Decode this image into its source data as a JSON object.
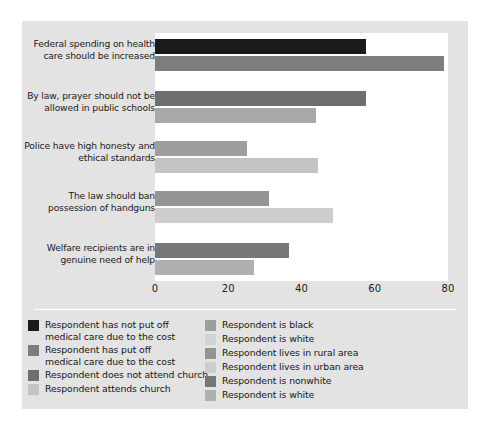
{
  "chart_data": {
    "type": "bar",
    "orientation": "horizontal",
    "title": "",
    "xlabel": "",
    "ylabel": "",
    "xlim": [
      0,
      80
    ],
    "xticks": [
      "0",
      "20",
      "40",
      "60",
      "80"
    ],
    "grid": false,
    "legend_position": "bottom",
    "categories": [
      "Federal spending on health\ncare should be increased",
      "By law, prayer should not be\nallowed in public schools",
      "Police have high honesty and\nethical standards",
      "The law should ban\npossession of handguns",
      "Welfare recipients are in\ngenuine need of help"
    ],
    "groups": [
      {
        "category": "Federal spending on health care should be increased",
        "bars": [
          {
            "label": "Respondent has not put off medical care due to the cost",
            "value": 57.5,
            "color": "#1a1a1a"
          },
          {
            "label": "Respondent has put off medical care due to the cost",
            "value": 79.0,
            "color": "#7d7d7d"
          }
        ]
      },
      {
        "category": "By law, prayer should not be allowed in public schools",
        "bars": [
          {
            "label": "Respondent does not attend church",
            "value": 57.5,
            "color": "#6e6e6e"
          },
          {
            "label": "Respondent attends church",
            "value": 44.0,
            "color": "#a8a8a8"
          }
        ]
      },
      {
        "category": "Police have high honesty and ethical standards",
        "bars": [
          {
            "label": "Respondent is black",
            "value": 25.0,
            "color": "#9e9e9e"
          },
          {
            "label": "Respondent is white",
            "value": 44.5,
            "color": "#c4c4c4"
          }
        ]
      },
      {
        "category": "The law should ban possession of handguns",
        "bars": [
          {
            "label": "Respondent lives in rural area",
            "value": 31.0,
            "color": "#949494"
          },
          {
            "label": "Respondent lives in urban area",
            "value": 48.5,
            "color": "#cdcdcd"
          }
        ]
      },
      {
        "category": "Welfare recipients are in genuine need of help",
        "bars": [
          {
            "label": "Respondent is nonwhite",
            "value": 36.5,
            "color": "#777777"
          },
          {
            "label": "Respondent is white",
            "value": 27.0,
            "color": "#b0b0b0"
          }
        ]
      }
    ],
    "legend": {
      "left_column": [
        {
          "label": "Respondent has not put off\nmedical care due to the cost",
          "color": "#1a1a1a"
        },
        {
          "label": "Respondent has put off\nmedical care due to the cost",
          "color": "#7d7d7d"
        },
        {
          "label": "Respondent does not attend church",
          "color": "#6e6e6e"
        },
        {
          "label": "Respondent attends church",
          "color": "#c4c4c4"
        }
      ],
      "right_column": [
        {
          "label": "Respondent is black",
          "color": "#9e9e9e"
        },
        {
          "label": "Respondent is white",
          "color": "#d3d3d3"
        },
        {
          "label": "Respondent lives in rural area",
          "color": "#949494"
        },
        {
          "label": "Respondent lives in urban area",
          "color": "#cdcdcd"
        },
        {
          "label": "Respondent is nonwhite",
          "color": "#777777"
        },
        {
          "label": "Respondent is white",
          "color": "#b0b0b0"
        }
      ]
    },
    "style": {
      "figure_background": "#e3e3e3",
      "panel_band_color": "#ffffff",
      "text_color": "#1b1b1b"
    }
  }
}
